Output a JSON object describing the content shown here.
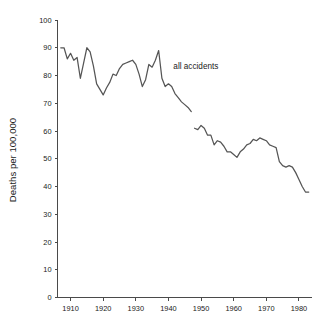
{
  "chart_data": {
    "type": "line",
    "title": "",
    "xlabel": "",
    "ylabel": "Deaths per 100,000",
    "xlim": [
      1906,
      1984
    ],
    "ylim": [
      0,
      100
    ],
    "grid": false,
    "legend_position": "inline-annotation",
    "x_ticks": [
      1910,
      1920,
      1930,
      1940,
      1950,
      1960,
      1970,
      1980
    ],
    "x_tick_labels": [
      "1910",
      "1920",
      "1930",
      "1940",
      "1950",
      "1960",
      "1970",
      "1980"
    ],
    "y_ticks": [
      0,
      10,
      20,
      30,
      40,
      50,
      60,
      70,
      80,
      90,
      100
    ],
    "y_tick_labels": [
      "0",
      "10",
      "20",
      "30",
      "40",
      "50",
      "60",
      "70",
      "80",
      "90",
      "100"
    ],
    "annotations": [
      {
        "text": "all accidents",
        "x": 1941.5,
        "y": 82.5
      }
    ],
    "series": [
      {
        "name": "all accidents",
        "color": "#555555",
        "segments": [
          {
            "x": [
              1907,
              1908,
              1909,
              1910,
              1911,
              1912,
              1913,
              1914,
              1915,
              1916,
              1917,
              1918,
              1919,
              1920,
              1921,
              1922,
              1923,
              1924,
              1925,
              1926,
              1927,
              1928,
              1929,
              1930,
              1931,
              1932,
              1933,
              1934,
              1935,
              1936,
              1937,
              1938,
              1939,
              1940,
              1941,
              1942,
              1943,
              1944,
              1945,
              1946,
              1947
            ],
            "y": [
              90.0,
              90.0,
              86.0,
              88.0,
              85.5,
              86.5,
              79.0,
              84.5,
              90.0,
              88.5,
              83.5,
              77.0,
              75.0,
              73.0,
              75.5,
              77.5,
              80.5,
              80.0,
              82.5,
              84.0,
              84.5,
              85.0,
              85.5,
              84.0,
              80.5,
              76.0,
              78.5,
              84.0,
              83.0,
              85.5,
              89.0,
              79.0,
              76.0,
              77.0,
              76.0,
              73.5,
              72.0,
              70.5,
              69.5,
              68.5,
              67.0
            ]
          },
          {
            "x": [
              1948,
              1949,
              1950,
              1951,
              1952,
              1953,
              1954,
              1955,
              1956,
              1957,
              1958,
              1959,
              1960,
              1961,
              1962,
              1963,
              1964,
              1965,
              1966,
              1967,
              1968,
              1969,
              1970,
              1971,
              1972,
              1973,
              1974,
              1975,
              1976,
              1977,
              1978,
              1979,
              1980,
              1981,
              1982,
              1983
            ],
            "y": [
              61.0,
              60.5,
              62.0,
              61.0,
              58.5,
              58.5,
              55.0,
              56.5,
              56.0,
              54.5,
              52.5,
              52.5,
              51.5,
              50.5,
              52.5,
              53.5,
              55.0,
              55.5,
              57.0,
              56.5,
              57.5,
              57.0,
              56.5,
              55.0,
              54.5,
              54.0,
              49.0,
              47.5,
              47.0,
              47.5,
              47.0,
              45.0,
              42.5,
              40.0,
              38.0,
              38.0
            ]
          }
        ]
      }
    ]
  },
  "axis": {
    "y_label": "Deaths per 100,000"
  }
}
